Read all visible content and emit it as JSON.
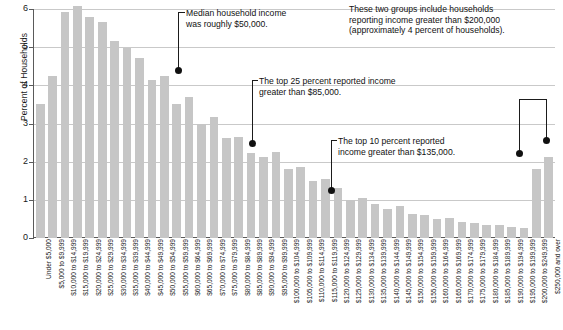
{
  "chart_data": {
    "type": "bar",
    "title": "",
    "xlabel": "",
    "ylabel": "Percent of Households",
    "ylim": [
      0,
      6
    ],
    "yticks": [
      0,
      1,
      2,
      3,
      4,
      5,
      6
    ],
    "grid": true,
    "legend": "none",
    "bar_color": "#c6c6c6",
    "categories": [
      "Under $5,000",
      "$5,000 to $9,999",
      "$10,000 to $14,999",
      "$15,000 to $19,999",
      "$20,000 to $24,999",
      "$25,000 to $29,999",
      "$30,000 to $34,999",
      "$35,000 to $39,999",
      "$40,000 to $44,999",
      "$45,000 to $49,999",
      "$50,000 to $54,999",
      "$55,000 to $59,999",
      "$60,000 to $64,999",
      "$65,000 to $69,999",
      "$70,000 to $74,999",
      "$75,000 to $79,999",
      "$80,000 to $84,999",
      "$85,000 to $89,999",
      "$90,000 to $94,999",
      "$95,000 to $99,999",
      "$100,000 to $104,999",
      "$105,000 to $109,999",
      "$110,000 to $114,999",
      "$115,000 to $119,999",
      "$120,000 to $124,999",
      "$125,000 to $129,999",
      "$130,000 to $134,999",
      "$135,000 to $139,999",
      "$140,000 to $144,999",
      "$145,000 to $149,999",
      "$150,000 to $154,999",
      "$155,000 to $159,999",
      "$160,000 to $164,999",
      "$165,000 to $169,999",
      "$170,000 to $174,999",
      "$175,000 to $179,999",
      "$180,000 to $184,999",
      "$185,000 to $189,999",
      "$190,000 to $194,999",
      "$195,000 to $199,999",
      "$200,000 to $249,999",
      "$250,000 and over"
    ],
    "values": [
      3.5,
      4.25,
      5.93,
      6.08,
      5.8,
      5.65,
      5.16,
      4.99,
      4.72,
      4.13,
      4.25,
      3.52,
      3.69,
      3.0,
      3.16,
      2.62,
      2.65,
      2.22,
      2.12,
      2.25,
      1.82,
      1.85,
      1.5,
      1.55,
      1.3,
      1.0,
      1.05,
      0.88,
      0.75,
      0.85,
      0.62,
      0.6,
      0.5,
      0.52,
      0.42,
      0.4,
      0.33,
      0.35,
      0.3,
      0.25,
      1.82,
      2.12
    ]
  },
  "annotations": {
    "median": {
      "line1": "Median household income",
      "line2": "was roughly $50,000.",
      "target_category": "$50,000 to $54,999",
      "target_value": 4.25
    },
    "top25": {
      "line1": "The top 25 percent reported income",
      "line2": "greater than $85,000.",
      "target_category": "$85,000 to $89,999",
      "target_value": 2.22
    },
    "top10": {
      "line1": "The top 10 percent reported",
      "line2": "income greater than $135,000.",
      "target_category": "$130,000 to $134,999",
      "target_value": 1.0
    },
    "topgroups": {
      "line1": "These two groups include households",
      "line2": "reporting income greater than $200,000",
      "line3": "(approximately 4 percent of households).",
      "target_categories": [
        "$200,000 to $249,999",
        "$250,000 and over"
      ],
      "target_values": [
        1.82,
        2.12
      ]
    }
  }
}
